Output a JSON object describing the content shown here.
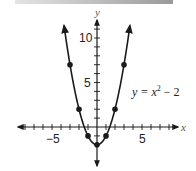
{
  "chart_data": {
    "type": "line",
    "title": "",
    "equation_label": "y = x² − 2",
    "equation_parts": {
      "lhs": "y = x",
      "exp": "2",
      "rhs": " − 2"
    },
    "xlabel": "x",
    "ylabel": "y",
    "x_tick_labels": [
      "−5",
      "5"
    ],
    "y_tick_labels": [
      "5",
      "10"
    ],
    "xlim": [
      -8,
      8
    ],
    "ylim": [
      -3,
      11
    ],
    "grid": false,
    "series": [
      {
        "name": "y = x^2 - 2",
        "x": [
          -3,
          -2,
          -1,
          0,
          1,
          2,
          3
        ],
        "y": [
          7,
          2,
          -1,
          -2,
          -1,
          2,
          7
        ],
        "marker": "circle"
      }
    ],
    "colors": {
      "curve": "#1a1a1a",
      "axes": "#1a1a1a",
      "topbar": "#a0a0a0"
    }
  }
}
